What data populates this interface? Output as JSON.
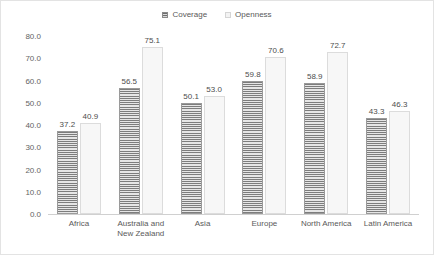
{
  "chart_data": {
    "type": "bar",
    "title": "",
    "xlabel": "",
    "ylabel": "",
    "ylim": [
      0.0,
      80.0
    ],
    "ytick_step": 10.0,
    "ytick_labels": [
      "80.0",
      "70.0",
      "60.0",
      "50.0",
      "40.0",
      "30.0",
      "20.0",
      "10.0",
      "0.0"
    ],
    "grid": false,
    "legend_position": "top-center",
    "categories": [
      "Africa",
      "Australia and New Zealand",
      "Asia",
      "Europe",
      "North America",
      "Latin America"
    ],
    "category_lines": [
      [
        "Africa"
      ],
      [
        "Australia and",
        "New Zealand"
      ],
      [
        "Asia"
      ],
      [
        "Europe"
      ],
      [
        "North America"
      ],
      [
        "Latin America"
      ]
    ],
    "series": [
      {
        "name": "Coverage",
        "color": "#7d7d7d",
        "pattern": "horizontal-lines",
        "values": [
          37.2,
          56.5,
          50.1,
          59.8,
          58.9,
          43.3
        ],
        "labels": [
          "37.2",
          "56.5",
          "50.1",
          "59.8",
          "58.9",
          "43.3"
        ]
      },
      {
        "name": "Openness",
        "color": "#f7f7f7",
        "pattern": "solid",
        "values": [
          40.9,
          75.1,
          53.0,
          70.6,
          72.7,
          46.3
        ],
        "labels": [
          "40.9",
          "75.1",
          "53.0",
          "70.6",
          "72.7",
          "46.3"
        ]
      }
    ]
  },
  "legend": {
    "items": [
      {
        "label": "Coverage"
      },
      {
        "label": "Openness"
      }
    ]
  }
}
